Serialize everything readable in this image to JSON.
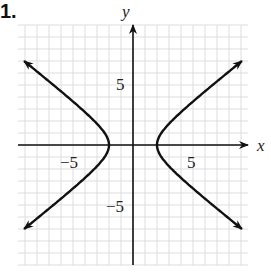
{
  "problem_number": "1.",
  "chart_data": {
    "type": "line",
    "title": "",
    "xlabel": "x",
    "ylabel": "y",
    "xlim": [
      -9.5,
      9.5
    ],
    "ylim": [
      -10,
      10
    ],
    "grid": true,
    "x_tick_labels": [
      "-5",
      "5"
    ],
    "y_tick_labels": [
      "5",
      "-5"
    ],
    "series": [
      {
        "name": "hyperbola right branch",
        "equation": "x^2/4 - y^2/2.5 = 1",
        "vertex": [
          2,
          0
        ],
        "endpoints": [
          [
            9.2,
            7.0
          ],
          [
            9.2,
            -7.0
          ]
        ]
      },
      {
        "name": "hyperbola left branch",
        "equation": "x^2/4 - y^2/2.5 = 1",
        "vertex": [
          -2,
          0
        ],
        "endpoints": [
          [
            -9.2,
            7.0
          ],
          [
            -9.2,
            -7.0
          ]
        ]
      }
    ]
  },
  "labels": {
    "x": "x",
    "y": "y",
    "xneg5": "−5",
    "xpos5": "5",
    "ypos5": "5",
    "yneg5": "−5"
  }
}
